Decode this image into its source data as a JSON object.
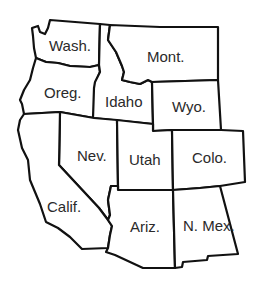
{
  "map": {
    "region": "Western United States",
    "states": [
      {
        "id": "wash",
        "label": "Wash."
      },
      {
        "id": "oreg",
        "label": "Oreg."
      },
      {
        "id": "idaho",
        "label": "Idaho"
      },
      {
        "id": "mont",
        "label": "Mont."
      },
      {
        "id": "wyo",
        "label": "Wyo."
      },
      {
        "id": "nev",
        "label": "Nev."
      },
      {
        "id": "utah",
        "label": "Utah"
      },
      {
        "id": "colo",
        "label": "Colo."
      },
      {
        "id": "calif",
        "label": "Calif."
      },
      {
        "id": "ariz",
        "label": "Ariz."
      },
      {
        "id": "nmex",
        "label": "N. Mex."
      }
    ],
    "colors": {
      "fill": "#ffffff",
      "border": "#111111",
      "text": "#2a2a2a"
    }
  }
}
